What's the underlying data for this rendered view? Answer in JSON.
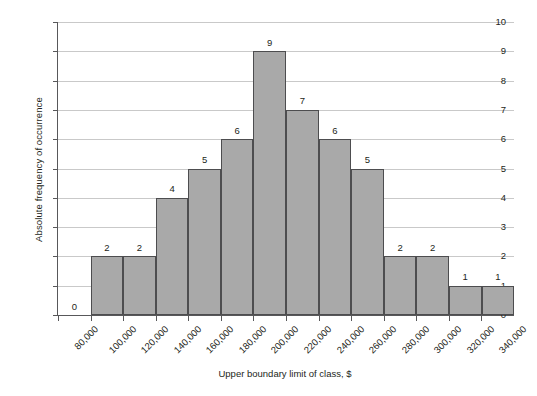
{
  "chart_data": {
    "type": "bar",
    "title": "",
    "xlabel": "Upper boundary limit of class, $",
    "ylabel": "Absolute frequency of occurrence",
    "categories": [
      "80,000",
      "100,000",
      "120,000",
      "140,000",
      "160,000",
      "180,000",
      "200,000",
      "220,000",
      "240,000",
      "260,000",
      "280,000",
      "300,000",
      "320,000",
      "340,000"
    ],
    "values": [
      0,
      2,
      2,
      4,
      5,
      6,
      9,
      7,
      6,
      5,
      2,
      2,
      1,
      1
    ],
    "ylim": [
      0,
      10
    ],
    "ytick_labels": [
      "10",
      "9",
      "8",
      "7",
      "6",
      "5",
      "4",
      "3",
      "2",
      "1",
      "0"
    ],
    "ytick_values": [
      10,
      9,
      8,
      7,
      6,
      5,
      4,
      3,
      2,
      1,
      0
    ],
    "grid": "horizontal",
    "legend": "none",
    "bar_color": "#a9a9a9",
    "bar_edge_color": "#4d4d4f",
    "gridline_color": "#c9c9c9",
    "axis_color": "#58585a",
    "text_color": "#231f20",
    "xtick_rotation": -45,
    "data_labels_shown": true
  }
}
